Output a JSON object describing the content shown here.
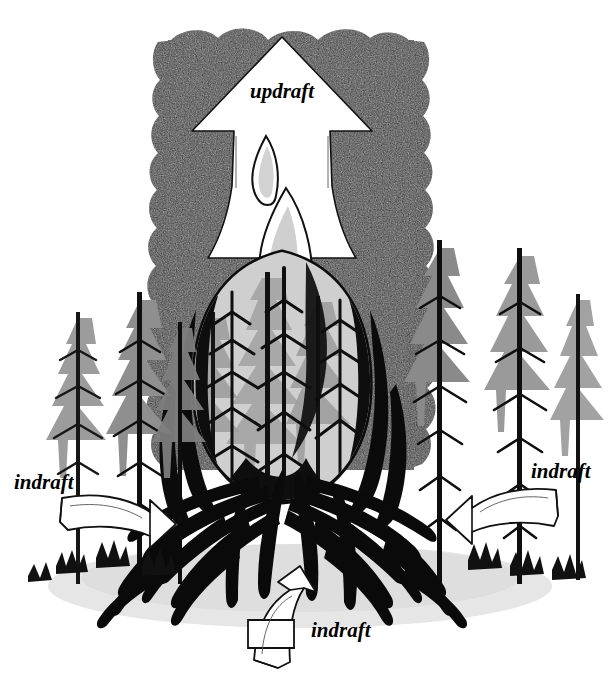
{
  "figure": {
    "width": 616,
    "height": 698,
    "background_color": "#ffffff",
    "style": "black-and-white pen-and-ink illustration"
  },
  "labels": {
    "updraft": {
      "text": "updraft",
      "x": 250,
      "y": 90,
      "style": "italic-serif",
      "color": "#000000"
    },
    "indraft_left": {
      "text": "indraft",
      "x": 14,
      "y": 490,
      "style": "italic-serif",
      "color": "#000000"
    },
    "indraft_right": {
      "text": "indraft",
      "x": 532,
      "y": 478,
      "style": "italic-serif",
      "color": "#000000"
    },
    "indraft_bottom": {
      "text": "indraft",
      "x": 312,
      "y": 636,
      "style": "italic-serif",
      "color": "#000000"
    }
  },
  "elements": {
    "smoke_column": {
      "name": "smoke-column",
      "description": "Dark scalloped convection smoke column rising from the fire",
      "fill": "#2a2a2a",
      "edge": "scalloped cloud lobes",
      "top": 30,
      "bottom": 470,
      "left": 148,
      "right": 432
    },
    "updraft_arrow": {
      "name": "updraft-arrow",
      "description": "Large white arrow pointing up through the smoke column",
      "fill": "#ffffff",
      "stroke": "#000000",
      "tip_x": 282,
      "tip_y": 37,
      "direction": "up"
    },
    "flame_core": {
      "name": "flame-core",
      "description": "Central teardrop flame envelope with burning trees visible inside",
      "fill": "#c9c9c9",
      "outline": "#000000"
    },
    "fire_base": {
      "name": "fire-base",
      "description": "Dense black radiating flame strokes at the base of the fire",
      "fill": "#000000"
    },
    "ground_shadow": {
      "name": "ground-shadow",
      "description": "Pale gray cast shadow on the ground beneath the fire",
      "fill": "#e0e0e0"
    },
    "indraft_arrow_left": {
      "name": "indraft-arrow-left",
      "description": "Curved white 3D band arrow pointing right toward the fire",
      "fill": "#ffffff",
      "stroke": "#000000",
      "direction": "right"
    },
    "indraft_arrow_right": {
      "name": "indraft-arrow-right",
      "description": "Curved white 3D band arrow pointing left toward the fire",
      "fill": "#ffffff",
      "stroke": "#000000",
      "direction": "left"
    },
    "indraft_arrow_bottom": {
      "name": "indraft-arrow-bottom",
      "description": "Curved white 3D band arrow bending up toward the fire from the foreground",
      "fill": "#ffffff",
      "stroke": "#000000",
      "direction": "up"
    },
    "trees": {
      "name": "conifer-trees",
      "description": "Tall conifer trees with dark trunks and gray feathery foliage surrounding the fire",
      "trunk_color": "#111111",
      "foliage_color": "#9a9a9a",
      "count_left": 4,
      "count_right": 4,
      "count_in_flame": 5
    }
  },
  "colors": {
    "paper": "#ffffff",
    "ink": "#000000",
    "smoke_dark": "#2a2a2a",
    "smoke_mid": "#3c3c3c",
    "foliage_gray": "#9a9a9a",
    "flame_gray": "#c9c9c9",
    "flame_light": "#ededed",
    "shadow_gray": "#e0e0e0"
  }
}
